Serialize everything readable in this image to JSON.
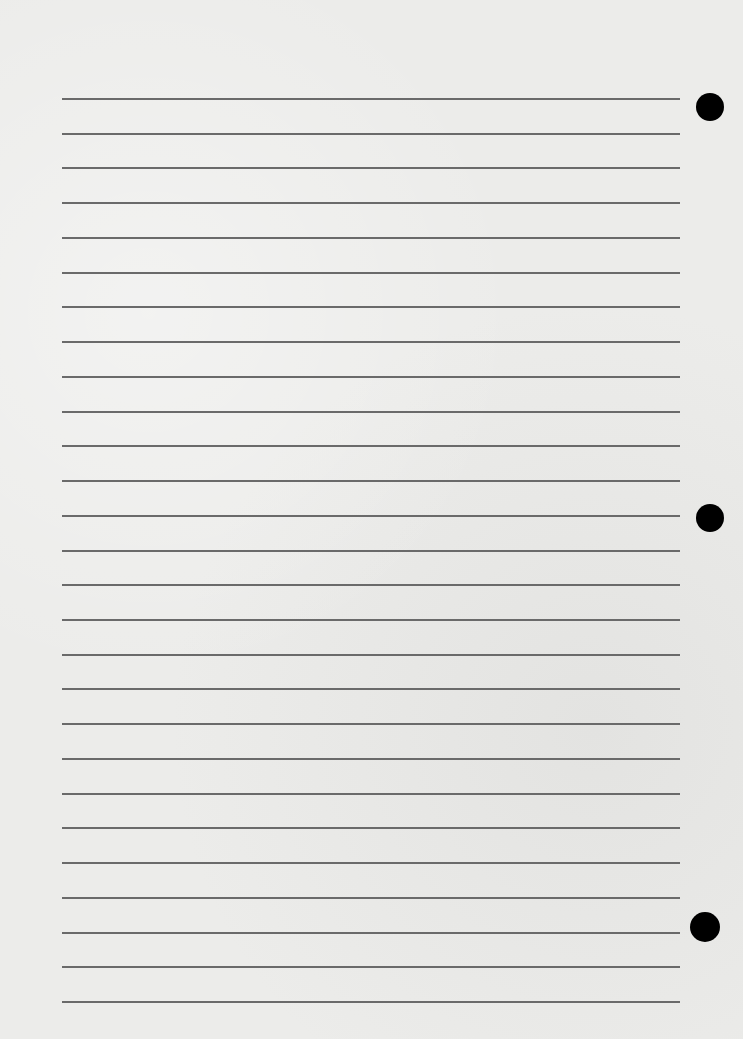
{
  "page": {
    "type": "lined-notebook-paper",
    "background_color": "#ececea",
    "rule_color": "#6a6a6a",
    "rule_count": 27,
    "rule_left": 62,
    "rule_right": 680,
    "first_rule_y": 98,
    "last_rule_y": 1001,
    "holes": [
      {
        "cx": 710,
        "cy": 107,
        "r": 14
      },
      {
        "cx": 710,
        "cy": 518,
        "r": 14
      },
      {
        "cx": 705,
        "cy": 927,
        "r": 15
      }
    ]
  }
}
